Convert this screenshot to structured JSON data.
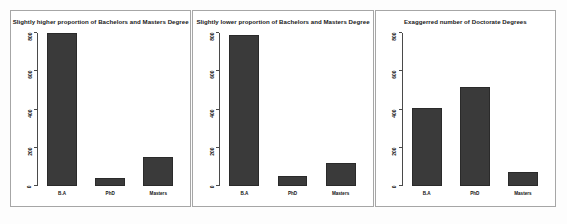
{
  "figure": {
    "background_color": "#fdfdfd",
    "panel_border_color": "#a6a6a6",
    "bar_color": "#3a3a3a",
    "axis_color": "#4a4a4a"
  },
  "chart_data": [
    {
      "type": "bar",
      "title": "Slightly higher proportion of Bachelors and Masters Degree",
      "categories": [
        "B.A",
        "PhD",
        "Masters"
      ],
      "values": [
        800,
        40,
        150
      ],
      "xlabel": "",
      "ylabel": "",
      "ylim": [
        0,
        800
      ],
      "yticks": [
        0,
        200,
        400,
        600,
        800
      ],
      "ytick_labels": [
        "0",
        "200",
        "400",
        "600",
        "800"
      ],
      "grid": false,
      "legend": "none"
    },
    {
      "type": "bar",
      "title": "Slightly lower  proportion of Bachelors and Masters Degree",
      "categories": [
        "B.A",
        "PhD",
        "Masters"
      ],
      "values": [
        790,
        52,
        120
      ],
      "xlabel": "",
      "ylabel": "",
      "ylim": [
        0,
        800
      ],
      "yticks": [
        0,
        200,
        400,
        600,
        800
      ],
      "ytick_labels": [
        "0",
        "200",
        "400",
        "600",
        "800"
      ],
      "grid": false,
      "legend": "none"
    },
    {
      "type": "bar",
      "title": "Exaggerred number of Doctorate Degrees",
      "categories": [
        "B.A",
        "PhD",
        "Masters"
      ],
      "values": [
        410,
        520,
        75
      ],
      "xlabel": "",
      "ylabel": "",
      "ylim": [
        0,
        800
      ],
      "yticks": [
        0,
        200,
        400,
        600,
        800
      ],
      "ytick_labels": [
        "0",
        "200",
        "400",
        "600",
        "800"
      ],
      "grid": false,
      "legend": "none"
    }
  ]
}
